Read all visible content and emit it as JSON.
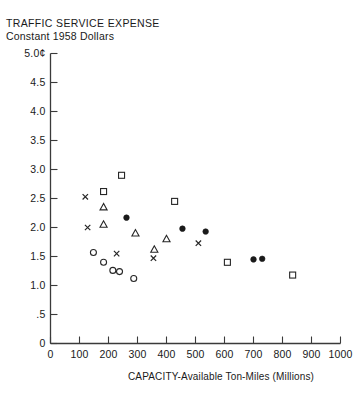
{
  "header": {
    "cropped_top_line": "",
    "title_line1": "TRAFFIC SERVICE EXPENSE",
    "title_line2": "Constant 1958 Dollars"
  },
  "axes": {
    "y_unit_label": "5.0¢",
    "x_axis_label": "CAPACITY-Available Ton-Miles (Millions)",
    "y_tick_labels": [
      "5.0¢",
      "4.5",
      "4.0",
      "3.5",
      "3.0",
      "2.5",
      "2.0",
      "1.5",
      "1.0",
      ".5",
      "0"
    ],
    "x_tick_labels": [
      "0",
      "100",
      "200",
      "300",
      "400",
      "500",
      "600",
      "700",
      "800",
      "900",
      "1000"
    ]
  },
  "chart_data": {
    "type": "scatter",
    "title": "TRAFFIC SERVICE EXPENSE",
    "subtitle": "Constant 1958 Dollars",
    "xlabel": "CAPACITY-Available Ton-Miles (Millions)",
    "ylabel": "Constant 1958 Dollars (cents)",
    "xlim": [
      0,
      1000
    ],
    "ylim": [
      0,
      5.0
    ],
    "xticks": [
      0,
      100,
      200,
      300,
      400,
      500,
      600,
      700,
      800,
      900,
      1000
    ],
    "yticks": [
      0,
      0.5,
      1.0,
      1.5,
      2.0,
      2.5,
      3.0,
      3.5,
      4.0,
      4.5,
      5.0
    ],
    "ytick_labels": [
      "0",
      ".5",
      "1.0",
      "1.5",
      "2.0",
      "2.5",
      "3.0",
      "3.5",
      "4.0",
      "4.5",
      "5.0¢"
    ],
    "grid": false,
    "legend": "none",
    "series": [
      {
        "name": "open-square",
        "marker": "open-square",
        "points": [
          {
            "x": 245,
            "y": 2.9
          },
          {
            "x": 183,
            "y": 2.62
          },
          {
            "x": 428,
            "y": 2.45
          },
          {
            "x": 610,
            "y": 1.4
          },
          {
            "x": 835,
            "y": 1.18
          }
        ]
      },
      {
        "name": "open-triangle",
        "marker": "open-triangle",
        "points": [
          {
            "x": 183,
            "y": 2.35
          },
          {
            "x": 183,
            "y": 2.05
          },
          {
            "x": 293,
            "y": 1.9
          },
          {
            "x": 400,
            "y": 1.8
          },
          {
            "x": 358,
            "y": 1.62
          }
        ]
      },
      {
        "name": "filled-circle",
        "marker": "filled-circle",
        "points": [
          {
            "x": 262,
            "y": 2.17
          },
          {
            "x": 455,
            "y": 1.98
          },
          {
            "x": 535,
            "y": 1.93
          },
          {
            "x": 700,
            "y": 1.45
          },
          {
            "x": 730,
            "y": 1.46
          }
        ]
      },
      {
        "name": "open-circle",
        "marker": "open-circle",
        "points": [
          {
            "x": 148,
            "y": 1.57
          },
          {
            "x": 183,
            "y": 1.4
          },
          {
            "x": 215,
            "y": 1.26
          },
          {
            "x": 238,
            "y": 1.24
          },
          {
            "x": 287,
            "y": 1.12
          }
        ]
      },
      {
        "name": "x-mark",
        "marker": "x",
        "points": [
          {
            "x": 120,
            "y": 2.53
          },
          {
            "x": 128,
            "y": 2.0
          },
          {
            "x": 228,
            "y": 1.55
          },
          {
            "x": 355,
            "y": 1.47
          },
          {
            "x": 510,
            "y": 1.73
          }
        ]
      }
    ]
  }
}
